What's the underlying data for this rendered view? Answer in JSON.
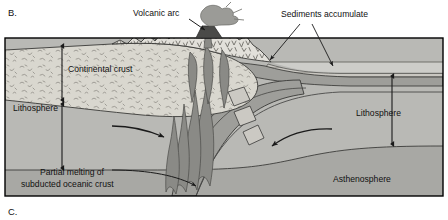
{
  "figure": {
    "panel_label_top": "B.",
    "panel_label_bottom": "C.",
    "type": "geologic-cross-section"
  },
  "labels": {
    "volcanic_arc": "Volcanic arc",
    "sediments_accumulate": "Sediments accumulate",
    "continental_crust": "Continental crust",
    "lithosphere_left": "Lithosphere",
    "lithosphere_right": "Lithosphere",
    "asthenosphere": "Asthenosphere",
    "partial_melting_line1": "Partial melting of",
    "partial_melting_line2": "subducted oceanic crust"
  },
  "colors": {
    "background": "#ffffff",
    "frame_stroke": "#000000",
    "continental_crust": "#d9d7cf",
    "lithosphere": "#b9b9b5",
    "asthenosphere": "#a8a8a4",
    "ocean_water": "#cdcdc9",
    "oceanic_crust": "#9e9e9a",
    "magma": "#8a8a86",
    "sediment": "#c4c2bc",
    "volcano_plume": "#9b9b97",
    "arrow": "#1a1a1a",
    "text": "#111111"
  },
  "annotations": {
    "arrow_mantle_flow_right": "rightward mantle flow arrow beneath continent",
    "arrow_mantle_flow_left": "leftward corner-flow arrow in mantle wedge",
    "arrow_sediment_trench": "arrow to trench sediments",
    "arrow_sediment_ocean": "arrow to ocean-floor sediments",
    "arrow_melt_source": "arrow to partial melting zone at slab top",
    "depth_bar_left": "left lithosphere thickness indicator",
    "depth_bar_right": "right lithosphere thickness indicator",
    "crust_thickness_bar": "continental crust thickness indicator"
  }
}
